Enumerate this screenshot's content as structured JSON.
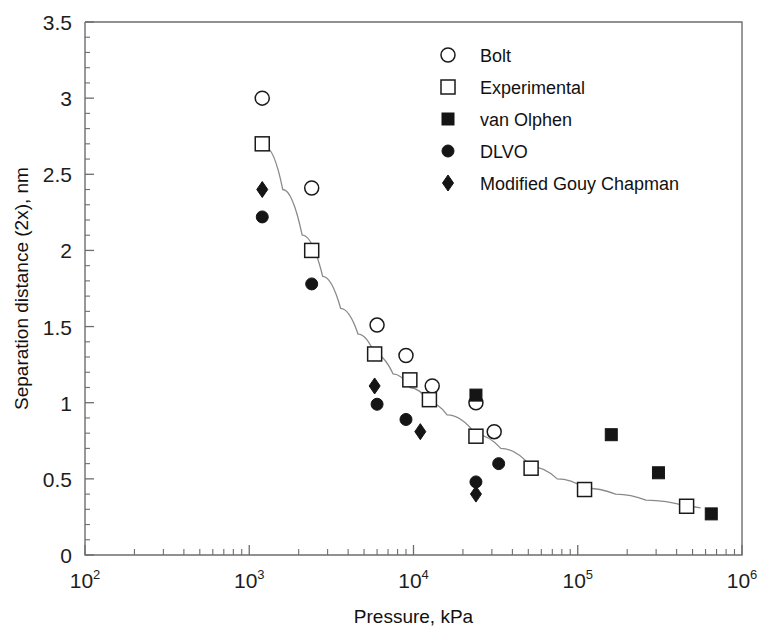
{
  "chart_data": {
    "type": "scatter",
    "title": "",
    "xlabel": "Pressure, kPa",
    "ylabel": "Separation distance (2x), nm",
    "xscale": "log",
    "yscale": "linear",
    "xlim": [
      100,
      1000000
    ],
    "ylim": [
      0,
      3.5
    ],
    "grid": false,
    "legend_position": "top-right",
    "x_tick_labels": [
      "10",
      "10",
      "10",
      "10",
      "10"
    ],
    "x_tick_exponents": [
      "2",
      "3",
      "4",
      "5",
      "6"
    ],
    "x_tick_values": [
      100,
      1000,
      10000,
      100000,
      1000000
    ],
    "y_tick_labels": [
      "0",
      "0.5",
      "1",
      "1.5",
      "2",
      "2.5",
      "3",
      "3.5"
    ],
    "y_tick_values": [
      0,
      0.5,
      1,
      1.5,
      2,
      2.5,
      3,
      3.5
    ],
    "series": [
      {
        "name": "Bolt",
        "marker": "open-circle",
        "color": "#151515",
        "points": [
          {
            "x": 1200,
            "y": 3.0
          },
          {
            "x": 2400,
            "y": 2.41
          },
          {
            "x": 6000,
            "y": 1.51
          },
          {
            "x": 9000,
            "y": 1.31
          },
          {
            "x": 13000,
            "y": 1.11
          },
          {
            "x": 24000,
            "y": 1.0
          },
          {
            "x": 31000,
            "y": 0.81
          }
        ]
      },
      {
        "name": "Experimental",
        "marker": "open-square",
        "color": "#151515",
        "points": [
          {
            "x": 1200,
            "y": 2.7
          },
          {
            "x": 2400,
            "y": 2.0
          },
          {
            "x": 5800,
            "y": 1.32
          },
          {
            "x": 9500,
            "y": 1.15
          },
          {
            "x": 12500,
            "y": 1.02
          },
          {
            "x": 24000,
            "y": 0.78
          },
          {
            "x": 52000,
            "y": 0.57
          },
          {
            "x": 110000,
            "y": 0.43
          },
          {
            "x": 460000,
            "y": 0.32
          }
        ]
      },
      {
        "name": "van Olphen",
        "marker": "filled-square",
        "color": "#151515",
        "points": [
          {
            "x": 24000,
            "y": 1.05
          },
          {
            "x": 160000,
            "y": 0.79
          },
          {
            "x": 310000,
            "y": 0.54
          },
          {
            "x": 650000,
            "y": 0.27
          }
        ]
      },
      {
        "name": "DLVO",
        "marker": "filled-circle",
        "color": "#151515",
        "points": [
          {
            "x": 1200,
            "y": 2.22
          },
          {
            "x": 2400,
            "y": 1.78
          },
          {
            "x": 6000,
            "y": 0.99
          },
          {
            "x": 9000,
            "y": 0.89
          },
          {
            "x": 24000,
            "y": 0.48
          },
          {
            "x": 33000,
            "y": 0.6
          }
        ]
      },
      {
        "name": "Modified Gouy Chapman",
        "marker": "filled-diamond",
        "color": "#151515",
        "points": [
          {
            "x": 1200,
            "y": 2.4
          },
          {
            "x": 5800,
            "y": 1.11
          },
          {
            "x": 11000,
            "y": 0.81
          },
          {
            "x": 24000,
            "y": 0.4
          }
        ]
      }
    ],
    "fit_curve": {
      "name": "fit-line",
      "points": [
        {
          "x": 1250,
          "y": 2.68
        },
        {
          "x": 1600,
          "y": 2.4
        },
        {
          "x": 2100,
          "y": 2.1
        },
        {
          "x": 2800,
          "y": 1.83
        },
        {
          "x": 3600,
          "y": 1.62
        },
        {
          "x": 4600,
          "y": 1.45
        },
        {
          "x": 5800,
          "y": 1.32
        },
        {
          "x": 7500,
          "y": 1.19
        },
        {
          "x": 9500,
          "y": 1.1
        },
        {
          "x": 12500,
          "y": 1.0
        },
        {
          "x": 16000,
          "y": 0.92
        },
        {
          "x": 24000,
          "y": 0.79
        },
        {
          "x": 34000,
          "y": 0.7
        },
        {
          "x": 52000,
          "y": 0.58
        },
        {
          "x": 75000,
          "y": 0.5
        },
        {
          "x": 110000,
          "y": 0.44
        },
        {
          "x": 170000,
          "y": 0.4
        },
        {
          "x": 260000,
          "y": 0.36
        },
        {
          "x": 460000,
          "y": 0.32
        },
        {
          "x": 560000,
          "y": 0.31
        }
      ]
    }
  },
  "legend": {
    "items": [
      {
        "label": "Bolt",
        "marker": "open-circle"
      },
      {
        "label": "Experimental",
        "marker": "open-square"
      },
      {
        "label": "van Olphen",
        "marker": "filled-square"
      },
      {
        "label": "DLVO",
        "marker": "filled-circle"
      },
      {
        "label": "Modified Gouy Chapman",
        "marker": "filled-diamond"
      }
    ]
  },
  "axes": {
    "x_title": "Pressure, kPa",
    "y_title": "Separation distance (2x), nm"
  }
}
